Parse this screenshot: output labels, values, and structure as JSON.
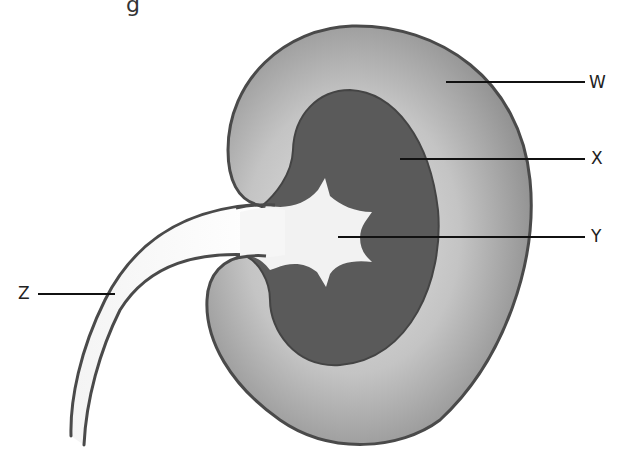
{
  "diagram": {
    "labels": [
      {
        "id": "W",
        "text": "W",
        "part": "cortex"
      },
      {
        "id": "X",
        "text": "X",
        "part": "medulla"
      },
      {
        "id": "Y",
        "text": "Y",
        "part": "renal pelvis"
      },
      {
        "id": "Z",
        "text": "Z",
        "part": "ureter"
      }
    ],
    "colors": {
      "outline": "#4a4a4a",
      "cortex_light": "#d6d6d6",
      "cortex_dark": "#8f8f8f",
      "medulla": "#5a5a5a",
      "pelvis": "#f2f2f2",
      "ureter": "#f7f7f7",
      "leader_line": "#111111"
    },
    "top_fragment": "g"
  }
}
